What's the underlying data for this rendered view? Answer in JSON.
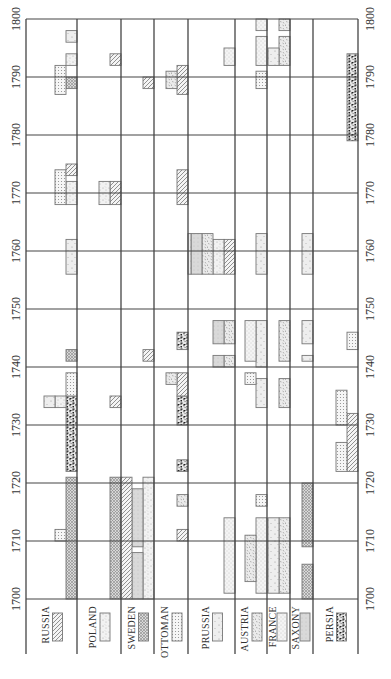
{
  "chart_data": {
    "type": "timeline",
    "title": "",
    "orientation": "rotated-90",
    "xlabel": "",
    "ylabel": "",
    "year_range": [
      1700,
      1800
    ],
    "year_ticks": [
      1700,
      1710,
      1720,
      1730,
      1740,
      1750,
      1760,
      1770,
      1780,
      1790,
      1800
    ],
    "grid": true,
    "legend_placement": "bottom (below each country column)",
    "countries": [
      "RUSSIA",
      "POLAND",
      "SWEDEN",
      "OTTOMAN",
      "PRUSSIA",
      "AUSTRIA",
      "FRANCE",
      "SAXONY",
      "PERSIA"
    ],
    "legend": [
      {
        "country": "RUSSIA",
        "pattern": "diagonal-hatch"
      },
      {
        "country": "POLAND",
        "pattern": "light-speckle"
      },
      {
        "country": "SWEDEN",
        "pattern": "crosshatch"
      },
      {
        "country": "OTTOMAN",
        "pattern": "dot-grid"
      },
      {
        "country": "PRUSSIA",
        "pattern": "sparse-dots"
      },
      {
        "country": "AUSTRIA",
        "pattern": "dash-texture"
      },
      {
        "country": "FRANCE",
        "pattern": "fine-stipple"
      },
      {
        "country": "SAXONY",
        "pattern": "light-gray"
      },
      {
        "country": "PERSIA",
        "pattern": "dark-blotch"
      }
    ],
    "wars": [
      {
        "country": "RUSSIA",
        "opponent": "PERSIA",
        "start": 1722,
        "end": 1735
      },
      {
        "country": "RUSSIA",
        "opponent": "SWEDEN",
        "start": 1700,
        "end": 1721
      },
      {
        "country": "RUSSIA",
        "opponent": "OTTOMAN",
        "start": 1710,
        "end": 1712
      },
      {
        "country": "RUSSIA",
        "opponent": "SWEDEN",
        "start": 1741,
        "end": 1743
      },
      {
        "country": "RUSSIA",
        "opponent": "OTTOMAN",
        "start": 1735,
        "end": 1739
      },
      {
        "country": "RUSSIA",
        "opponent": "POLAND",
        "start": 1733,
        "end": 1735
      },
      {
        "country": "RUSSIA",
        "opponent": "PRUSSIA",
        "start": 1733,
        "end": 1735
      },
      {
        "country": "RUSSIA",
        "opponent": "PRUSSIA",
        "start": 1756,
        "end": 1762
      },
      {
        "country": "RUSSIA",
        "opponent": "POLAND",
        "start": 1768,
        "end": 1772
      },
      {
        "country": "RUSSIA",
        "opponent": "OTTOMAN",
        "start": 1768,
        "end": 1774
      },
      {
        "country": "RUSSIA",
        "opponent": "RUSSIA",
        "start": 1773,
        "end": 1775
      },
      {
        "country": "RUSSIA",
        "opponent": "SWEDEN",
        "start": 1788,
        "end": 1790
      },
      {
        "country": "RUSSIA",
        "opponent": "OTTOMAN",
        "start": 1787,
        "end": 1792
      },
      {
        "country": "RUSSIA",
        "opponent": "POLAND",
        "start": 1792,
        "end": 1794
      },
      {
        "country": "RUSSIA",
        "opponent": "PRUSSIA",
        "start": 1796,
        "end": 1798
      },
      {
        "country": "POLAND",
        "opponent": "SWEDEN",
        "start": 1700,
        "end": 1721
      },
      {
        "country": "POLAND",
        "opponent": "RUSSIA",
        "start": 1733,
        "end": 1735
      },
      {
        "country": "POLAND",
        "opponent": "RUSSIA",
        "start": 1768,
        "end": 1772
      },
      {
        "country": "POLAND",
        "opponent": "RUSSIA",
        "start": 1792,
        "end": 1794
      },
      {
        "country": "POLAND",
        "opponent": "POLAND",
        "start": 1768,
        "end": 1772
      },
      {
        "country": "SWEDEN",
        "opponent": "POLAND",
        "start": 1700,
        "end": 1721
      },
      {
        "country": "SWEDEN",
        "opponent": "SAXONY",
        "start": 1700,
        "end": 1708
      },
      {
        "country": "SWEDEN",
        "opponent": "SAXONY",
        "start": 1709,
        "end": 1719
      },
      {
        "country": "SWEDEN",
        "opponent": "RUSSIA",
        "start": 1700,
        "end": 1721
      },
      {
        "country": "SWEDEN",
        "opponent": "RUSSIA",
        "start": 1741,
        "end": 1743
      },
      {
        "country": "SWEDEN",
        "opponent": "RUSSIA",
        "start": 1788,
        "end": 1790
      },
      {
        "country": "OTTOMAN",
        "opponent": "RUSSIA",
        "start": 1710,
        "end": 1712
      },
      {
        "country": "OTTOMAN",
        "opponent": "AUSTRIA",
        "start": 1716,
        "end": 1718
      },
      {
        "country": "OTTOMAN",
        "opponent": "PERSIA",
        "start": 1722,
        "end": 1724
      },
      {
        "country": "OTTOMAN",
        "opponent": "PERSIA",
        "start": 1730,
        "end": 1735
      },
      {
        "country": "OTTOMAN",
        "opponent": "RUSSIA",
        "start": 1735,
        "end": 1739
      },
      {
        "country": "OTTOMAN",
        "opponent": "AUSTRIA",
        "start": 1737,
        "end": 1739
      },
      {
        "country": "OTTOMAN",
        "opponent": "PERSIA",
        "start": 1743,
        "end": 1746
      },
      {
        "country": "OTTOMAN",
        "opponent": "RUSSIA",
        "start": 1768,
        "end": 1774
      },
      {
        "country": "OTTOMAN",
        "opponent": "RUSSIA",
        "start": 1787,
        "end": 1792
      },
      {
        "country": "OTTOMAN",
        "opponent": "AUSTRIA",
        "start": 1788,
        "end": 1791
      },
      {
        "country": "PRUSSIA",
        "opponent": "FRANCE",
        "start": 1701,
        "end": 1714
      },
      {
        "country": "PRUSSIA",
        "opponent": "AUSTRIA",
        "start": 1740,
        "end": 1742
      },
      {
        "country": "PRUSSIA",
        "opponent": "AUSTRIA",
        "start": 1744,
        "end": 1748
      },
      {
        "country": "PRUSSIA",
        "opponent": "SAXONY",
        "start": 1740,
        "end": 1742
      },
      {
        "country": "PRUSSIA",
        "opponent": "SAXONY",
        "start": 1744,
        "end": 1748
      },
      {
        "country": "PRUSSIA",
        "opponent": "RUSSIA",
        "start": 1756,
        "end": 1762
      },
      {
        "country": "PRUSSIA",
        "opponent": "POLAND",
        "start": 1756,
        "end": 1762
      },
      {
        "country": "PRUSSIA",
        "opponent": "AUSTRIA",
        "start": 1756,
        "end": 1763
      },
      {
        "country": "PRUSSIA",
        "opponent": "SAXONY",
        "start": 1756,
        "end": 1763
      },
      {
        "country": "PRUSSIA",
        "opponent": "PRUSSIA",
        "start": 1756,
        "end": 1763
      },
      {
        "country": "PRUSSIA",
        "opponent": "FRANCE",
        "start": 1792,
        "end": 1795
      },
      {
        "country": "AUSTRIA",
        "opponent": "FRANCE",
        "start": 1701,
        "end": 1714
      },
      {
        "country": "AUSTRIA",
        "opponent": "AUSTRIA",
        "start": 1703,
        "end": 1711
      },
      {
        "country": "AUSTRIA",
        "opponent": "OTTOMAN",
        "start": 1716,
        "end": 1718
      },
      {
        "country": "AUSTRIA",
        "opponent": "PRUSSIA",
        "start": 1733,
        "end": 1738
      },
      {
        "country": "AUSTRIA",
        "opponent": "OTTOMAN",
        "start": 1737,
        "end": 1739
      },
      {
        "country": "AUSTRIA",
        "opponent": "PRUSSIA",
        "start": 1740,
        "end": 1748
      },
      {
        "country": "AUSTRIA",
        "opponent": "FRANCE",
        "start": 1741,
        "end": 1748
      },
      {
        "country": "AUSTRIA",
        "opponent": "PRUSSIA",
        "start": 1756,
        "end": 1763
      },
      {
        "country": "AUSTRIA",
        "opponent": "OTTOMAN",
        "start": 1788,
        "end": 1791
      },
      {
        "country": "AUSTRIA",
        "opponent": "FRANCE",
        "start": 1792,
        "end": 1797
      },
      {
        "country": "AUSTRIA",
        "opponent": "FRANCE",
        "start": 1798,
        "end": 1800
      },
      {
        "country": "FRANCE",
        "opponent": "AUSTRIA",
        "start": 1701,
        "end": 1714
      },
      {
        "country": "FRANCE",
        "opponent": "PRUSSIA",
        "start": 1701,
        "end": 1714
      },
      {
        "country": "FRANCE",
        "opponent": "AUSTRIA",
        "start": 1733,
        "end": 1738
      },
      {
        "country": "FRANCE",
        "opponent": "AUSTRIA",
        "start": 1741,
        "end": 1748
      },
      {
        "country": "FRANCE",
        "opponent": "AUSTRIA",
        "start": 1792,
        "end": 1797
      },
      {
        "country": "FRANCE",
        "opponent": "PRUSSIA",
        "start": 1792,
        "end": 1795
      },
      {
        "country": "FRANCE",
        "opponent": "AUSTRIA",
        "start": 1798,
        "end": 1800
      },
      {
        "country": "SAXONY",
        "opponent": "SWEDEN",
        "start": 1700,
        "end": 1706
      },
      {
        "country": "SAXONY",
        "opponent": "SWEDEN",
        "start": 1709,
        "end": 1720
      },
      {
        "country": "SAXONY",
        "opponent": "PRUSSIA",
        "start": 1741,
        "end": 1742
      },
      {
        "country": "SAXONY",
        "opponent": "PRUSSIA",
        "start": 1744,
        "end": 1748
      },
      {
        "country": "SAXONY",
        "opponent": "PRUSSIA",
        "start": 1756,
        "end": 1763
      },
      {
        "country": "PERSIA",
        "opponent": "RUSSIA",
        "start": 1722,
        "end": 1732
      },
      {
        "country": "PERSIA",
        "opponent": "OTTOMAN",
        "start": 1722,
        "end": 1727
      },
      {
        "country": "PERSIA",
        "opponent": "OTTOMAN",
        "start": 1730,
        "end": 1736
      },
      {
        "country": "PERSIA",
        "opponent": "OTTOMAN",
        "start": 1743,
        "end": 1746
      },
      {
        "country": "PERSIA",
        "opponent": "PERSIA",
        "start": 1779,
        "end": 1794
      }
    ]
  }
}
